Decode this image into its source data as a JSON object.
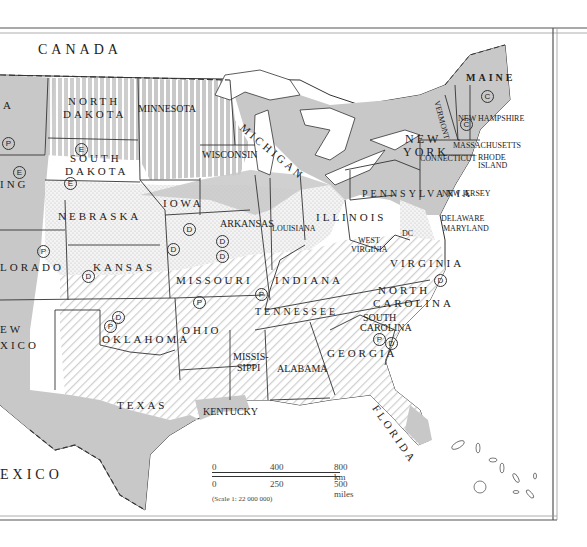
{
  "map": {
    "colors": {
      "land_shaded": "#c8c8c8",
      "land_white": "#ffffff",
      "border": "#333333",
      "hatch": "#d6d6d6"
    },
    "countries": [
      {
        "label": "CANADA"
      },
      {
        "label": "EXICO"
      }
    ],
    "states": [
      {
        "id": "north-dakota",
        "label_line1": "NORTH",
        "label_line2": "DAKOTA"
      },
      {
        "id": "south-dakota",
        "label_line1": "SOUTH",
        "label_line2": "DAKOTA"
      },
      {
        "id": "minnesota",
        "label": "MINNESOTA"
      },
      {
        "id": "wisconsin",
        "label": "WISCONSIN"
      },
      {
        "id": "michigan",
        "label": "MICHIGAN"
      },
      {
        "id": "iowa",
        "label": "IOWA"
      },
      {
        "id": "nebraska",
        "label": "NEBRASKA"
      },
      {
        "id": "kansas",
        "label": "KANSAS"
      },
      {
        "id": "oklahoma",
        "label": "OKLAHOMA"
      },
      {
        "id": "texas",
        "label": "TEXAS"
      },
      {
        "id": "colorado",
        "label": "LORADO"
      },
      {
        "id": "wyoming",
        "label": "ING"
      },
      {
        "id": "montana",
        "label": "A"
      },
      {
        "id": "new-mexico",
        "label_line1": "EW",
        "label_line2": "XICO"
      },
      {
        "id": "missouri",
        "label": "MISSOURI"
      },
      {
        "id": "arkansas",
        "label": "ARKANSAS"
      },
      {
        "id": "louisiana",
        "label": "LOUISIANA"
      },
      {
        "id": "illinois",
        "label": "ILLINOIS"
      },
      {
        "id": "indiana",
        "label": "INDIANA"
      },
      {
        "id": "ohio",
        "label": "OHIO"
      },
      {
        "id": "kentucky",
        "label": "KENTUCKY"
      },
      {
        "id": "tennessee",
        "label": "TENNESSEE"
      },
      {
        "id": "mississippi",
        "label_line1": "MISSIS-",
        "label_line2": "SIPPI"
      },
      {
        "id": "alabama",
        "label": "ALABAMA"
      },
      {
        "id": "georgia",
        "label": "GEORGIA"
      },
      {
        "id": "florida",
        "label": "FLORIDA"
      },
      {
        "id": "south-carolina",
        "label_line1": "SOUTH",
        "label_line2": "CAROLINA"
      },
      {
        "id": "north-carolina",
        "label_line1": "NORTH",
        "label_line2": "CAROLINA"
      },
      {
        "id": "virginia",
        "label": "VIRGINIA"
      },
      {
        "id": "west-virginia",
        "label_line1": "WEST",
        "label_line2": "VIRGINIA"
      },
      {
        "id": "pennsylvania",
        "label": "PENNSYLVANIA"
      },
      {
        "id": "new-york",
        "label_line1": "NEW",
        "label_line2": "YORK"
      },
      {
        "id": "new-jersey",
        "label": "NEW JERSEY"
      },
      {
        "id": "delaware",
        "label": "DELAWARE"
      },
      {
        "id": "maryland",
        "label": "MARYLAND"
      },
      {
        "id": "dc",
        "label": "DC"
      },
      {
        "id": "connecticut",
        "label": "CONNECTICUT"
      },
      {
        "id": "rhode-island",
        "label_line1": "RHODE",
        "label_line2": "ISLAND"
      },
      {
        "id": "massachusetts",
        "label": "MASSACHUSETTS"
      },
      {
        "id": "vermont",
        "label": "VERMONT"
      },
      {
        "id": "new-hampshire",
        "label": "NEW HAMPSHIRE"
      },
      {
        "id": "maine",
        "label": "MAINE"
      }
    ],
    "markers": {
      "P": "P",
      "E": "E",
      "D": "D",
      "C": "C"
    },
    "scale": {
      "km_ticks": [
        "0",
        "400",
        "800 km"
      ],
      "mile_ticks": [
        "0",
        "250",
        "500 miles"
      ],
      "ratio": "(Scale 1: 22 000 000)"
    }
  }
}
